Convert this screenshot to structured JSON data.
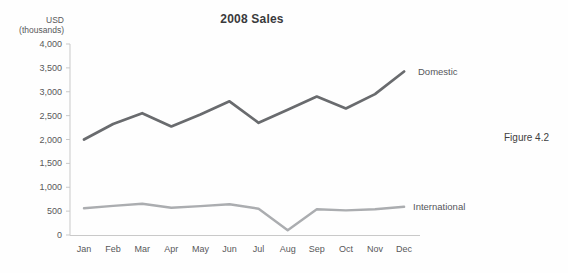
{
  "figure": {
    "caption": "Figure 4.2"
  },
  "chart": {
    "title": "2008 Sales",
    "y_axis_label": {
      "line1": "USD",
      "line2": "(thousands)"
    },
    "series_end_labels": {
      "domestic": "Domestic",
      "international": "International"
    }
  },
  "colors": {
    "domestic_line": "#696b6e",
    "international_line": "#abadb0",
    "axis": "#c9c9c9",
    "tick_text": "#58585a"
  },
  "chart_data": {
    "type": "line",
    "title": "2008 Sales",
    "ylabel": "USD (thousands)",
    "xlabel": "",
    "categories": [
      "Jan",
      "Feb",
      "Mar",
      "Apr",
      "May",
      "Jun",
      "Jul",
      "Aug",
      "Sep",
      "Oct",
      "Nov",
      "Dec"
    ],
    "series": [
      {
        "name": "Domestic",
        "color": "#696b6e",
        "values": [
          2000,
          2325,
          2550,
          2275,
          2525,
          2800,
          2350,
          2625,
          2900,
          2650,
          2950,
          3425
        ]
      },
      {
        "name": "International",
        "color": "#abadb0",
        "values": [
          560,
          610,
          655,
          570,
          605,
          645,
          550,
          100,
          540,
          515,
          540,
          590
        ]
      }
    ],
    "ylim": [
      0,
      4000
    ],
    "yticks": [
      0,
      500,
      1000,
      1500,
      2000,
      2500,
      3000,
      3500,
      4000
    ],
    "grid": false,
    "legend": "inline-end-of-line-labels"
  }
}
